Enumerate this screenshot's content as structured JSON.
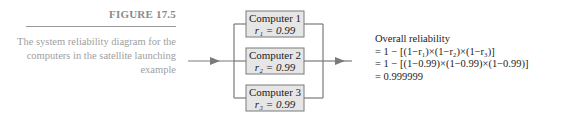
{
  "caption": {
    "figure_label": "FIGURE 17.5",
    "text": "The system reliability diagram for the computers in the satellite launching example"
  },
  "diagram": {
    "components": [
      {
        "name": "Computer 1",
        "reliability": "r₁ = 0.99"
      },
      {
        "name": "Computer 2",
        "reliability": "r₂ = 0.99"
      },
      {
        "name": "Computer 3",
        "reliability": "r₃ = 0.99"
      }
    ],
    "colors": {
      "box_fill": "#e6e6e6",
      "line": "#7a7a7a"
    }
  },
  "formula": {
    "title": "Overall reliability",
    "line1": "= 1 − [(1−r₁)×(1−r₂)×(1−r₃)]",
    "line2": "= 1 − [(1−0.99)×(1−0.99)×(1−0.99)]",
    "line3": "= 0.999999"
  }
}
